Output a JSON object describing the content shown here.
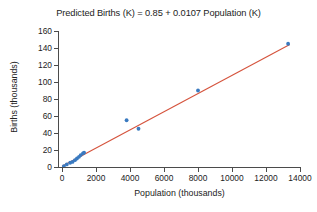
{
  "chart_data": {
    "type": "scatter",
    "title": "Predicted Births (K) = 0.85 + 0.0107 Population (K)",
    "xlabel": "Population (thousands)",
    "ylabel": "Births (thousands)",
    "xlim": [
      0,
      14000
    ],
    "ylim": [
      0,
      160
    ],
    "xticks": [
      0,
      2000,
      4000,
      6000,
      8000,
      10000,
      12000,
      14000
    ],
    "yticks": [
      0,
      20,
      40,
      60,
      80,
      100,
      120,
      140,
      160
    ],
    "xtick_labels": [
      "0",
      "2000",
      "4000",
      "6000",
      "8000",
      "10000",
      "12000",
      "14000"
    ],
    "ytick_labels": [
      "0",
      "20",
      "40",
      "60",
      "80",
      "100",
      "120",
      "140",
      "160"
    ],
    "grid": false,
    "legend": "none",
    "point_color": "#3a7ac0",
    "line_color": "#d5533c",
    "axis_color": "#4b4b4b",
    "series": [
      {
        "name": "Observed births vs population",
        "marker": "circle",
        "points": [
          {
            "x": 110,
            "y": 1
          },
          {
            "x": 280,
            "y": 3
          },
          {
            "x": 480,
            "y": 5
          },
          {
            "x": 620,
            "y": 6
          },
          {
            "x": 760,
            "y": 8
          },
          {
            "x": 880,
            "y": 10
          },
          {
            "x": 1000,
            "y": 12
          },
          {
            "x": 1100,
            "y": 14
          },
          {
            "x": 1230,
            "y": 16
          },
          {
            "x": 1300,
            "y": 17
          },
          {
            "x": 3800,
            "y": 55
          },
          {
            "x": 4500,
            "y": 45
          },
          {
            "x": 8000,
            "y": 90
          },
          {
            "x": 13300,
            "y": 145
          }
        ]
      }
    ],
    "fit_line": {
      "name": "Least squares regression line",
      "equation": "Predicted Births (K) = 0.85 + 0.0107 Population (K)",
      "intercept": 0.85,
      "slope": 0.0107,
      "x_start": 0,
      "x_end": 13400,
      "y_start": 0.85,
      "y_end": 144.23
    }
  }
}
